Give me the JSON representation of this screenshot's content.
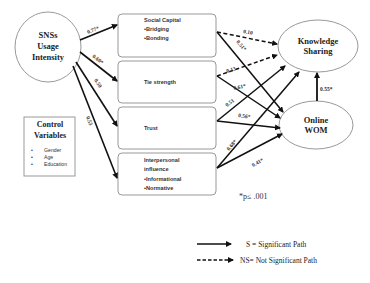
{
  "diagram": {
    "type": "structural-path-model",
    "source_node": {
      "id": "snss",
      "lines": [
        "SNSs",
        "Usage",
        "Intensity"
      ]
    },
    "mediators": [
      {
        "id": "social_capital",
        "title": "Social Capital",
        "bullets": [
          "•Bridging",
          "•Bonding"
        ]
      },
      {
        "id": "tie_strength",
        "title": "Tie strength",
        "bullets": []
      },
      {
        "id": "trust",
        "title": "Trust",
        "bullets": []
      },
      {
        "id": "interpersonal_influence",
        "title_lines": [
          "Interpersonal",
          "influence"
        ],
        "bullets": [
          "•Informational",
          "•Normative"
        ]
      }
    ],
    "outcomes": [
      {
        "id": "knowledge_sharing",
        "lines": [
          "Knowledge",
          "Sharing"
        ]
      },
      {
        "id": "online_wom",
        "lines": [
          "Online",
          "WOM"
        ]
      }
    ],
    "control": {
      "title_lines": [
        "Control",
        "Variables"
      ],
      "items": [
        "Gender",
        "Age",
        "Education"
      ]
    },
    "paths": [
      {
        "from": "snss",
        "to": "social_capital",
        "coef": "0.77*",
        "significant": true
      },
      {
        "from": "snss",
        "to": "tie_strength",
        "coef": "0.60*",
        "significant": true
      },
      {
        "from": "snss",
        "to": "trust",
        "coef": "0.50",
        "significant": true
      },
      {
        "from": "snss",
        "to": "interpersonal_influence",
        "coef": "0.53",
        "significant": true
      },
      {
        "from": "social_capital",
        "to": "knowledge_sharing",
        "coef": "0.10",
        "significant": false
      },
      {
        "from": "social_capital",
        "to": "online_wom",
        "coef": "0.51*",
        "significant": true
      },
      {
        "from": "tie_strength",
        "to": "knowledge_sharing",
        "coef": "0.13",
        "significant": false
      },
      {
        "from": "tie_strength",
        "to": "online_wom",
        "coef": "0.61*",
        "significant": true
      },
      {
        "from": "trust",
        "to": "knowledge_sharing",
        "coef": "0.51",
        "significant": true
      },
      {
        "from": "trust",
        "to": "online_wom",
        "coef": "0.56*",
        "significant": true
      },
      {
        "from": "interpersonal_influence",
        "to": "knowledge_sharing",
        "coef": "0.68*",
        "significant": true
      },
      {
        "from": "interpersonal_influence",
        "to": "online_wom",
        "coef": "0.41*",
        "significant": true
      },
      {
        "from": "online_wom",
        "to": "knowledge_sharing",
        "coef": "0.55*",
        "significant": true
      }
    ],
    "note": "*p≤ .001",
    "legend": {
      "significant": "S = Significant Path",
      "not_significant": "NS= Not Significant Path"
    }
  }
}
